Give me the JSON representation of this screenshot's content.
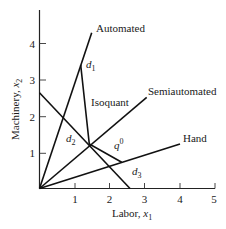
{
  "diagram": {
    "type": "isoquant-production-techniques",
    "axes": {
      "x": {
        "title_text": "Labor, ",
        "title_var": "x",
        "title_sub": "1",
        "ticks": [
          "1",
          "2",
          "3",
          "4",
          "5"
        ],
        "range": [
          0,
          5
        ]
      },
      "y": {
        "title_text": "Machinery, ",
        "title_var": "x",
        "title_sub": "2",
        "ticks": [
          "1",
          "2",
          "3",
          "4"
        ],
        "range": [
          0,
          4.8
        ]
      }
    },
    "rays": [
      {
        "name": "Automated",
        "label": "Automated"
      },
      {
        "name": "Semiautomated",
        "label": "Semiautomated"
      },
      {
        "name": "Hand",
        "label": "Hand"
      }
    ],
    "isoquant_label": "Isoquant",
    "points": {
      "d1": {
        "var": "d",
        "sub": "1"
      },
      "d2": {
        "var": "d",
        "sub": "2"
      },
      "d3": {
        "var": "d",
        "sub": "3"
      },
      "q0": {
        "var": "q",
        "sup": "0"
      }
    },
    "colors": {
      "line": "#111111",
      "background": "#ffffff"
    }
  }
}
